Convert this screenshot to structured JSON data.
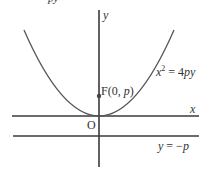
{
  "diagram": {
    "title_fragment": "py",
    "axes": {
      "x_label": "x",
      "y_label": "y",
      "origin_label": "O"
    },
    "focus": {
      "prefix": "F(0, ",
      "var": "p",
      "suffix": ")"
    },
    "parabola": {
      "equation_lhs_var": "x",
      "equation_exp": "2",
      "equation_rest": " = 4",
      "equation_vars": "py"
    },
    "directrix": {
      "lhs": "y",
      "rest": " = −",
      "var": "p"
    },
    "colors": {
      "line": "#3a3a3a",
      "curve": "#555555",
      "text": "#333333"
    }
  }
}
